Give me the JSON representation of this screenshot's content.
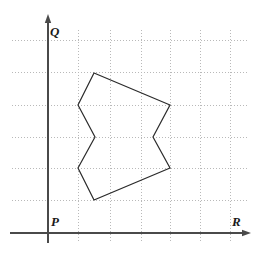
{
  "figure": {
    "width": 261,
    "height": 262,
    "background_color": "#ffffff"
  },
  "axes": {
    "vertical": {
      "name": "Q",
      "label": "Q",
      "label_x": 50,
      "label_y": 25,
      "x": 48,
      "y_top": 14,
      "y_bottom": 243,
      "arrow": "up",
      "color": "#4a4a4a"
    },
    "horizontal": {
      "name": "R",
      "label": "R",
      "label_x": 232,
      "label_y": 215,
      "y": 233,
      "x_left": 10,
      "x_right": 251,
      "arrow": "right",
      "color": "#4a4a4a"
    },
    "origin": {
      "label": "P",
      "label_x": 51,
      "label_y": 215,
      "x": 48,
      "y": 233
    }
  },
  "grid": {
    "color": "#b9b9b9",
    "style": "dotted",
    "stroke_width": 1,
    "dash_pattern": "1 2",
    "vertical_lines_x": [
      78,
      110,
      141,
      170,
      200,
      230
    ],
    "horizontal_lines_y": [
      40,
      72,
      105,
      137,
      168,
      200
    ],
    "vertical_extent": {
      "y_top": 30,
      "y_bottom": 243
    },
    "horizontal_extent": {
      "x_left": 12,
      "x_right": 247
    }
  },
  "chart_data": {
    "type": "scatter",
    "title": "",
    "xlabel": "R",
    "ylabel": "Q",
    "grid": true,
    "legend": false,
    "shapes": [
      {
        "name": "polygon",
        "closed": true,
        "stroke": "#2b2b2b",
        "stroke_width": 1.2,
        "fill": "none",
        "vertices": [
          {
            "x": 94,
            "y": 73
          },
          {
            "x": 170,
            "y": 105
          },
          {
            "x": 153,
            "y": 137
          },
          {
            "x": 170,
            "y": 168
          },
          {
            "x": 94,
            "y": 200
          },
          {
            "x": 78,
            "y": 168
          },
          {
            "x": 95,
            "y": 137
          },
          {
            "x": 78,
            "y": 105
          }
        ]
      }
    ]
  }
}
